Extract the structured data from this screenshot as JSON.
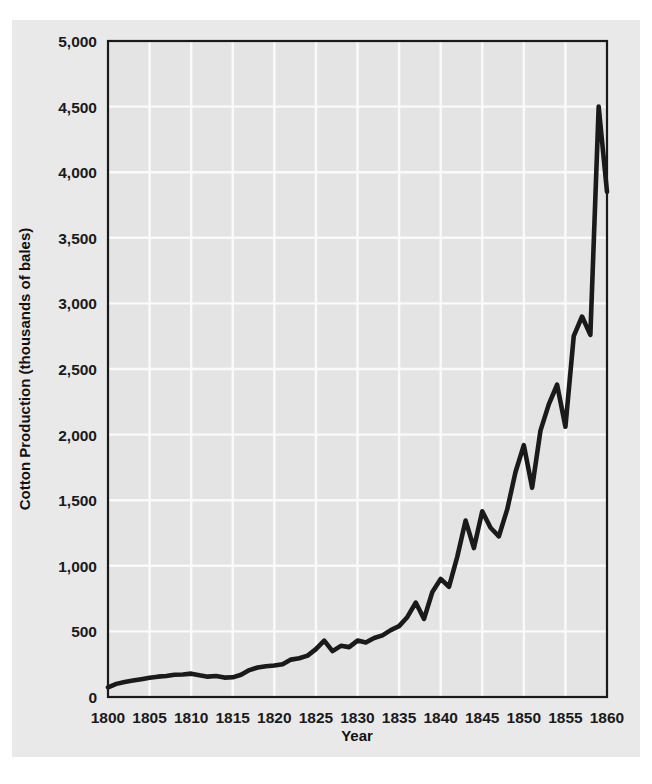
{
  "figure": {
    "background_color": "#ffffff",
    "card_color": "#e9e9e9",
    "plot_background_color": "#e4e4e4",
    "axis_color": "#1a1a1a",
    "grid_color": "#fafafa",
    "line_color": "#1a1a1a"
  },
  "chart_data": {
    "type": "line",
    "title": "",
    "subtitle": "",
    "xlabel": "Year",
    "ylabel": "Cotton Production (thousands of bales)",
    "xlim": [
      1800,
      1860
    ],
    "ylim": [
      0,
      5000
    ],
    "grid": true,
    "legend": "none",
    "x_ticks": [
      1800,
      1805,
      1810,
      1815,
      1820,
      1825,
      1830,
      1835,
      1840,
      1845,
      1850,
      1855,
      1860
    ],
    "x_tick_labels": [
      "1800",
      "1805",
      "1810",
      "1815",
      "1820",
      "1825",
      "1830",
      "1835",
      "1840",
      "1845",
      "1850",
      "1855",
      "1860"
    ],
    "y_ticks": [
      0,
      500,
      1000,
      1500,
      2000,
      2500,
      3000,
      3500,
      4000,
      4500,
      5000
    ],
    "y_tick_labels": [
      "0",
      "500",
      "1,000",
      "1,500",
      "2,000",
      "2,500",
      "3,000",
      "3,500",
      "4,000",
      "4,500",
      "5,000"
    ],
    "series": [
      {
        "name": "Cotton Production",
        "x": [
          1800,
          1801,
          1802,
          1803,
          1804,
          1805,
          1806,
          1807,
          1808,
          1809,
          1810,
          1811,
          1812,
          1813,
          1814,
          1815,
          1816,
          1817,
          1818,
          1819,
          1820,
          1821,
          1822,
          1823,
          1824,
          1825,
          1826,
          1827,
          1828,
          1829,
          1830,
          1831,
          1832,
          1833,
          1834,
          1835,
          1836,
          1837,
          1838,
          1839,
          1840,
          1841,
          1842,
          1843,
          1844,
          1845,
          1846,
          1847,
          1848,
          1849,
          1850,
          1851,
          1852,
          1853,
          1854,
          1855,
          1856,
          1857,
          1858,
          1859,
          1860
        ],
        "y": [
          73,
          100,
          115,
          125,
          135,
          146,
          155,
          160,
          170,
          172,
          178,
          165,
          155,
          160,
          148,
          150,
          170,
          205,
          225,
          235,
          240,
          250,
          285,
          295,
          315,
          365,
          430,
          350,
          390,
          380,
          430,
          415,
          450,
          470,
          510,
          540,
          610,
          720,
          595,
          800,
          900,
          840,
          1070,
          1345,
          1135,
          1415,
          1290,
          1225,
          1430,
          1715,
          1920,
          1595,
          2030,
          2230,
          2380,
          2060,
          2750,
          2900,
          2760,
          4500,
          3850
        ]
      }
    ],
    "annotations": []
  }
}
